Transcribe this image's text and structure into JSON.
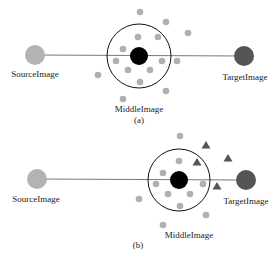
{
  "colors": {
    "source": "#b3b3b3",
    "target": "#555555",
    "middle": "#000000",
    "dot": "#b0b0b0",
    "triangle": "#555555",
    "line": "#555555",
    "ring": "#111111"
  },
  "panel_a": {
    "caption": "(a)",
    "source_label": "SourceImage",
    "target_label": "TargetImage",
    "middle_label": "MiddleImage",
    "source": {
      "cx": 35,
      "cy": 55,
      "r": 10
    },
    "target": {
      "cx": 244,
      "cy": 56,
      "r": 10
    },
    "middle": {
      "cx": 139,
      "cy": 56,
      "r": 9
    },
    "ring": {
      "cx": 139,
      "cy": 56,
      "r": 32
    },
    "dots": [
      [
        140,
        12
      ],
      [
        166,
        22
      ],
      [
        188,
        33
      ],
      [
        138,
        37
      ],
      [
        158,
        37
      ],
      [
        123,
        49
      ],
      [
        116,
        61
      ],
      [
        162,
        61
      ],
      [
        177,
        61
      ],
      [
        128,
        70
      ],
      [
        150,
        70
      ],
      [
        140,
        82
      ],
      [
        98,
        75
      ],
      [
        166,
        91
      ],
      [
        123,
        99
      ]
    ]
  },
  "panel_b": {
    "caption": "(b)",
    "source_label": "SourceImage",
    "target_label": "TargetImage",
    "middle_label": "MiddleImage",
    "source": {
      "cx": 37,
      "cy": 179,
      "r": 10
    },
    "target": {
      "cx": 246,
      "cy": 180,
      "r": 10
    },
    "middle": {
      "cx": 179,
      "cy": 180,
      "r": 9
    },
    "ring": {
      "cx": 179,
      "cy": 180,
      "r": 31
    },
    "dots": [
      [
        180,
        136
      ],
      [
        179,
        161
      ],
      [
        163,
        173
      ],
      [
        156,
        184
      ],
      [
        168,
        194
      ],
      [
        190,
        194
      ],
      [
        203,
        184
      ],
      [
        180,
        206
      ],
      [
        139,
        199
      ],
      [
        206,
        215
      ],
      [
        163,
        225
      ]
    ],
    "triangles": [
      [
        206,
        145
      ],
      [
        197,
        162
      ],
      [
        228,
        158
      ],
      [
        217,
        186
      ]
    ]
  }
}
